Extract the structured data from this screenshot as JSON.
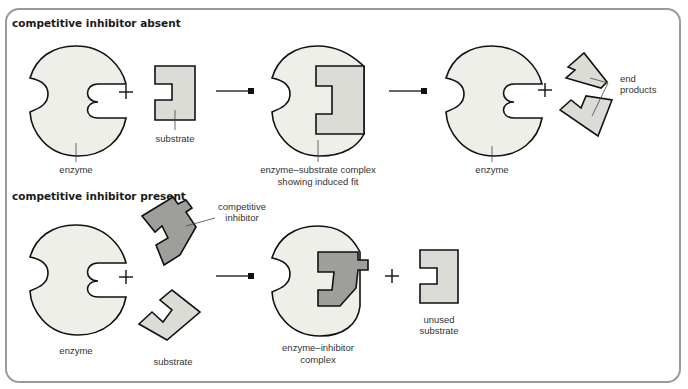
{
  "title_absent": "competitive inhibitor absent",
  "title_present": "competitive inhibitor present",
  "row1": {
    "enzyme": "enzyme",
    "substrate": "substrate",
    "complex_l1": "enzyme–substrate complex",
    "complex_l2": "showing induced fit",
    "enzyme2": "enzyme",
    "products_l1": "end",
    "products_l2": "products"
  },
  "row2": {
    "enzyme": "enzyme",
    "inhibitor_l1": "competitive",
    "inhibitor_l2": "inhibitor",
    "substrate": "substrate",
    "complex_l1": "enzyme–inhibitor",
    "complex_l2": "complex",
    "unused_l1": "unused",
    "unused_l2": "substrate"
  },
  "colors": {
    "enzyme": "#efefe9",
    "substrate": "#dcdcd6",
    "inhibitor": "#9e9e9a",
    "frame": "#9a9a9a"
  }
}
